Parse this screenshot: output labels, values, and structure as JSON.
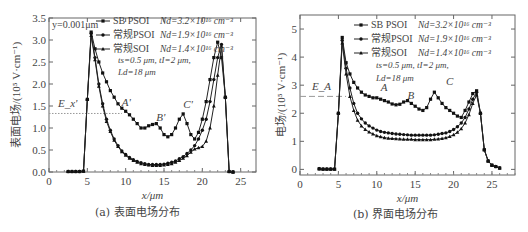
{
  "captions": {
    "left": "(a) 表面电场分布",
    "right": "(b) 界面电场分布"
  },
  "chart_data": [
    {
      "type": "line",
      "title": "表面电场分布",
      "panel": "(a)",
      "xlabel": "x/μm",
      "ylabel": "表面电场/(10⁵ V·cm⁻¹)",
      "xlim": [
        0,
        27
      ],
      "ylim": [
        0,
        3.5
      ],
      "xticks": [
        0,
        5,
        10,
        15,
        20,
        25
      ],
      "yticks": [
        "0.0",
        "0.5",
        "1.0",
        "1.5",
        "2.0",
        "2.5",
        "3.0",
        "3.5"
      ],
      "annotation_top": "y=0.001μm",
      "reference_line": {
        "label": "E_x'",
        "y": 1.33
      },
      "point_labels": [
        {
          "text": "A'",
          "x": 9.5,
          "y": 1.5
        },
        {
          "text": "B'",
          "x": 14.0,
          "y": 1.15
        },
        {
          "text": "C'",
          "x": 17.5,
          "y": 1.45
        }
      ],
      "legend": [
        {
          "name": "SB PSOI",
          "param": "Nd=3.2×10¹⁶ cm⁻³",
          "marker": "square"
        },
        {
          "name": "常规PSOI",
          "param": "Nd=1.9×10¹⁶ cm⁻³",
          "marker": "circle"
        },
        {
          "name": "常规SOI",
          "param": "Nd=1.4×10¹⁶ cm⁻³",
          "marker": "triangle"
        }
      ],
      "legend_note": [
        "ts=0.5 μm, tI=2 μm,",
        "Ld=18 μm"
      ],
      "series": [
        {
          "name": "SB PSOI",
          "x": [
            2.5,
            3,
            3.5,
            4,
            4.5,
            5,
            5.5,
            6,
            6.5,
            7,
            7.5,
            8,
            8.5,
            9,
            9.5,
            10,
            10.5,
            11,
            11.5,
            12,
            12.5,
            13,
            13.5,
            14,
            14.5,
            15,
            15.5,
            16,
            16.5,
            17,
            17.5,
            18,
            18.5,
            19,
            19.5,
            20,
            20.5,
            21,
            21.5,
            22,
            22.5,
            23,
            23.5,
            24
          ],
          "y": [
            0.01,
            0.01,
            0.01,
            0.01,
            0.02,
            1.65,
            3.18,
            2.8,
            2.5,
            2.25,
            2.05,
            1.85,
            1.7,
            1.55,
            1.45,
            1.38,
            1.3,
            1.2,
            1.1,
            1.0,
            1.0,
            1.05,
            1.08,
            1.1,
            1.0,
            0.85,
            0.8,
            0.85,
            1.0,
            1.2,
            1.32,
            1.1,
            0.85,
            0.75,
            0.9,
            1.2,
            1.6,
            2.1,
            2.6,
            2.95,
            2.6,
            1.7,
            0.01,
            0.0
          ]
        },
        {
          "name": "常规PSOI",
          "x": [
            2.5,
            3,
            3.5,
            4,
            4.5,
            5,
            5.5,
            6,
            6.5,
            7,
            7.5,
            8,
            8.5,
            9,
            9.5,
            10,
            10.5,
            11,
            11.5,
            12,
            12.5,
            13,
            13.5,
            14,
            14.5,
            15,
            15.5,
            16,
            16.5,
            17,
            17.5,
            18,
            18.5,
            19,
            19.5,
            20,
            20.5,
            21,
            21.5,
            22,
            22.5,
            23,
            23.5,
            24
          ],
          "y": [
            0.01,
            0.01,
            0.01,
            0.01,
            0.02,
            1.65,
            3.15,
            2.6,
            2.0,
            1.55,
            1.2,
            0.95,
            0.75,
            0.6,
            0.48,
            0.4,
            0.33,
            0.28,
            0.24,
            0.21,
            0.19,
            0.17,
            0.17,
            0.17,
            0.17,
            0.18,
            0.2,
            0.22,
            0.25,
            0.3,
            0.35,
            0.42,
            0.5,
            0.6,
            0.75,
            0.95,
            1.2,
            1.6,
            2.1,
            2.6,
            2.9,
            1.7,
            0.01,
            0.0
          ]
        },
        {
          "name": "常规SOI",
          "x": [
            2.5,
            3,
            3.5,
            4,
            4.5,
            5,
            5.5,
            6,
            6.5,
            7,
            7.5,
            8,
            8.5,
            9,
            9.5,
            10,
            10.5,
            11,
            11.5,
            12,
            12.5,
            13,
            13.5,
            14,
            14.5,
            15,
            15.5,
            16,
            16.5,
            17,
            17.5,
            18,
            18.5,
            19,
            19.5,
            20,
            20.5,
            21,
            21.5,
            22,
            22.5,
            23,
            23.5,
            24
          ],
          "y": [
            0.01,
            0.01,
            0.01,
            0.01,
            0.02,
            1.65,
            3.1,
            2.55,
            1.95,
            1.5,
            1.15,
            0.92,
            0.72,
            0.58,
            0.46,
            0.38,
            0.31,
            0.26,
            0.22,
            0.19,
            0.17,
            0.16,
            0.15,
            0.15,
            0.15,
            0.16,
            0.17,
            0.19,
            0.22,
            0.26,
            0.31,
            0.37,
            0.45,
            0.52,
            0.55,
            0.58,
            0.7,
            1.0,
            1.5,
            2.2,
            2.85,
            1.7,
            0.01,
            0.0
          ]
        }
      ]
    },
    {
      "type": "line",
      "title": "界面电场分布",
      "panel": "(b)",
      "xlabel": "x/μm",
      "ylabel": "电场/(10⁵ V·cm⁻¹)",
      "xlim": [
        0,
        28
      ],
      "ylim": [
        -0.2,
        5.5
      ],
      "xticks": [
        0,
        5,
        10,
        15,
        20,
        25
      ],
      "yticks": [
        "0",
        "1",
        "2",
        "3",
        "4",
        "5"
      ],
      "reference_line": {
        "label": "E_A",
        "y": 2.6
      },
      "point_labels": [
        {
          "text": "A",
          "x": 10.5,
          "y": 2.8
        },
        {
          "text": "B",
          "x": 14.0,
          "y": 2.5
        },
        {
          "text": "C",
          "x": 19.0,
          "y": 3.0
        }
      ],
      "legend": [
        {
          "name": "SB PSOI",
          "param": "Nd=3.2×10¹⁶ cm⁻³",
          "marker": "square"
        },
        {
          "name": "常规PSOI",
          "param": "Nd=1.9×10¹⁶ cm⁻³",
          "marker": "circle"
        },
        {
          "name": "常规SOI",
          "param": "Nd=1.4×10¹⁶ cm⁻³",
          "marker": "triangle"
        }
      ],
      "legend_note": [
        "ts=0.5 μm, tI=2 μm,",
        "Ld=18 μm"
      ],
      "series": [
        {
          "name": "SB PSOI",
          "x": [
            2.5,
            3,
            3.5,
            4,
            4.5,
            5,
            5.5,
            6,
            6.5,
            7,
            7.5,
            8,
            8.5,
            9,
            9.5,
            10,
            10.5,
            11,
            11.5,
            12,
            12.5,
            13,
            13.5,
            14,
            14.5,
            15,
            15.5,
            16,
            16.5,
            17,
            17.5,
            18,
            18.5,
            19,
            19.5,
            20,
            20.5,
            21,
            21.5,
            22,
            22.5,
            23,
            23.5,
            24,
            24.5,
            25,
            25.5,
            26
          ],
          "y": [
            0.02,
            0.01,
            0.01,
            0.01,
            0.01,
            2.0,
            4.7,
            3.8,
            3.4,
            3.1,
            2.9,
            2.75,
            2.65,
            2.6,
            2.55,
            2.55,
            2.5,
            2.45,
            2.4,
            2.33,
            2.3,
            2.32,
            2.4,
            2.45,
            2.35,
            2.25,
            2.15,
            2.1,
            2.2,
            2.5,
            2.75,
            2.55,
            2.35,
            2.2,
            2.1,
            2.0,
            1.9,
            1.85,
            2.1,
            2.4,
            2.7,
            2.8,
            2.0,
            0.7,
            0.3,
            0.15,
            0.1,
            0.05
          ]
        },
        {
          "name": "常规PSOI",
          "x": [
            2.5,
            3,
            3.5,
            4,
            4.5,
            5,
            5.5,
            6,
            6.5,
            7,
            7.5,
            8,
            8.5,
            9,
            9.5,
            10,
            10.5,
            11,
            11.5,
            12,
            12.5,
            13,
            13.5,
            14,
            14.5,
            15,
            15.5,
            16,
            16.5,
            17,
            17.5,
            18,
            18.5,
            19,
            19.5,
            20,
            20.5,
            21,
            21.5,
            22,
            22.5,
            23,
            23.5,
            24,
            24.5,
            25,
            25.5,
            26
          ],
          "y": [
            0.02,
            0.01,
            0.01,
            0.01,
            0.01,
            2.0,
            4.6,
            3.6,
            2.9,
            2.35,
            2.0,
            1.8,
            1.65,
            1.55,
            1.47,
            1.4,
            1.35,
            1.32,
            1.3,
            1.28,
            1.26,
            1.25,
            1.24,
            1.23,
            1.22,
            1.22,
            1.22,
            1.22,
            1.22,
            1.22,
            1.23,
            1.25,
            1.28,
            1.3,
            1.35,
            1.42,
            1.52,
            1.65,
            1.85,
            2.15,
            2.5,
            2.75,
            2.0,
            0.7,
            0.3,
            0.15,
            0.1,
            0.05
          ]
        },
        {
          "name": "常规SOI",
          "x": [
            2.5,
            3,
            3.5,
            4,
            4.5,
            5,
            5.5,
            6,
            6.5,
            7,
            7.5,
            8,
            8.5,
            9,
            9.5,
            10,
            10.5,
            11,
            11.5,
            12,
            12.5,
            13,
            13.5,
            14,
            14.5,
            15,
            15.5,
            16,
            16.5,
            17,
            17.5,
            18,
            18.5,
            19,
            19.5,
            20,
            20.5,
            21,
            21.5,
            22,
            22.5,
            23,
            23.5,
            24,
            24.5,
            25,
            25.5,
            26
          ],
          "y": [
            0.02,
            0.01,
            0.01,
            0.01,
            0.01,
            2.0,
            4.5,
            3.4,
            2.6,
            2.1,
            1.75,
            1.55,
            1.42,
            1.33,
            1.26,
            1.2,
            1.16,
            1.13,
            1.11,
            1.1,
            1.09,
            1.08,
            1.07,
            1.07,
            1.07,
            1.06,
            1.06,
            1.06,
            1.06,
            1.06,
            1.07,
            1.08,
            1.1,
            1.13,
            1.17,
            1.23,
            1.32,
            1.45,
            1.65,
            1.95,
            2.35,
            2.65,
            2.0,
            0.7,
            0.3,
            0.15,
            0.1,
            0.05
          ]
        }
      ]
    }
  ]
}
